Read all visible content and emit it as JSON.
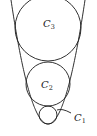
{
  "diagram": {
    "title": "",
    "parabola": {
      "vertex": [
        48,
        124
      ],
      "k": 0.0906,
      "x_range": [
        9,
        87
      ]
    },
    "circles": [
      {
        "id": "C1",
        "name": "C",
        "sub": "1",
        "cx": 48,
        "cy": 115,
        "r": 9,
        "label_pos": [
          74,
          121
        ],
        "leader": [
          [
            57,
            110
          ],
          [
            62,
            108
          ],
          [
            71,
            113
          ]
        ]
      },
      {
        "id": "C2",
        "name": "C",
        "sub": "2",
        "cx": 48,
        "cy": 84,
        "r": 22,
        "label_pos": [
          41,
          88
        ]
      },
      {
        "id": "C3",
        "name": "C",
        "sub": "3",
        "cx": 48,
        "cy": 28,
        "r": 33,
        "label_pos": [
          43,
          27
        ]
      }
    ],
    "labels": {
      "c1": "C",
      "c1_sub": "1",
      "c2": "C",
      "c2_sub": "2",
      "c3": "C",
      "c3_sub": "3"
    },
    "colors": {
      "stroke": "#1a1a1a",
      "background": "#ffffff"
    }
  }
}
